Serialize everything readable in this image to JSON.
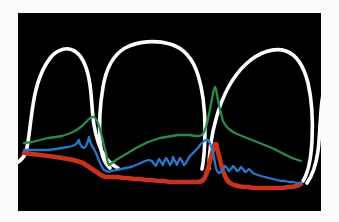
{
  "figure": {
    "background_color": "#fbfbf9",
    "panel_color": "#000000",
    "panel": {
      "x": 18,
      "y": 13,
      "width": 303,
      "height": 198
    }
  },
  "legend_colors": {
    "tooth_outline": "#ffffff",
    "green_curve": "#2a8a4a",
    "blue_curve": "#2878c8",
    "red_curve": "#c83220"
  },
  "series": [
    {
      "name": "gingival-margin",
      "color": "#2a8a4a",
      "label": "Gingival margin contour",
      "points": "6,130 14,129 22,127 30,125 38,124 44,123 50,121 55,119 60,116 64,113 67,110 70,107 72,105 74,104 76,104 78,106 80,110 82,116 84,124 86,132 88,140 89,146 90,150 91,152 94,150 98,147 103,144 108,141 113,138 118,135 124,132 130,129 136,127 142,125 148,124 154,123 160,122 166,122 172,122 177,123 181,123 184,122 186,119 188,114 190,106 192,96 194,86 195,80 196,76 197,74 198,76 199,82 201,92 203,101 205,108 208,113 211,116 215,119 219,121 224,123 229,125 234,127 239,129 244,131 249,133 254,135 258,137 262,139 266,141 270,143 274,145 277,146 280,147 283,148"
    },
    {
      "name": "attachment-level",
      "color": "#2878c8",
      "label": "Clinical attachment level",
      "points": "6,137 14,137 22,137 30,137 38,136 44,135 50,134 54,133 57,132 59,130 61,127 62,131 64,134 66,135 68,133 70,128 71,124 72,128 74,133 76,136 78,140 80,145 82,150 84,154 86,157 88,158 90,159 94,158 98,157 103,156 108,155 113,154 118,152 123,150 127,148 131,147 134,148 136,151 138,153 139,150 141,146 143,149 145,152 146,149 148,145 150,148 152,152 154,149 155,144 157,148 159,152 160,149 162,145 164,148 166,152 168,150 170,146 172,143 174,141 176,139 178,137 180,135 182,132 184,130 186,128 188,127 190,127 192,130 194,136 196,144 197,150 198,155 199,158 201,160 203,159 205,156 207,153 209,155 211,158 213,156 215,153 217,155 219,158 221,157 223,154 225,156 227,159 229,158 231,156 233,158 235,160 237,161 240,162 243,163 247,164 251,165 255,166 259,167 263,168 267,168 271,169 275,169 279,170 283,170"
    },
    {
      "name": "bone-level",
      "color": "#c83220",
      "label": "Alveolar bone level",
      "points": "6,140 14,141 22,142 30,143 38,144 44,145 50,146 55,147 59,148 62,149 65,150 68,152 71,154 74,156 77,158 80,160 83,162 85,163 87,164 89,164 92,164 96,164 100,164 105,165 110,165 116,166 122,166 128,167 134,167 140,168 146,168 152,169 158,169 164,169 170,169 176,169 181,169 184,168 186,166 188,162 190,156 192,148 194,140 196,134 197,131 198,131 199,135 201,143 203,151 205,158 207,163 209,167 212,170 216,172 220,173 225,174 230,174 235,175 240,175 245,175 250,175 255,175 260,175 265,175 270,174 274,174 278,173 281,172 283,171"
    }
  ],
  "teeth": [
    {
      "name": "tooth-left-lateral-incisor",
      "outline": "M -6,152 C 0,150 5,147 8,139 C 11,128 12,110 15,92 C 18,72 24,55 33,44 C 40,36 50,33 58,39 C 66,45 70,58 72,72 C 74,86 74,100 76,112 C 78,124 81,134 86,142 C 90,149 96,153 100,155"
    },
    {
      "name": "tooth-central-incisor-left",
      "outline": "M 92,155 C 86,150 83,140 82,128 C 81,112 82,92 85,74 C 88,56 95,42 107,35 C 120,28 138,27 152,31 C 166,35 175,46 180,62 C 185,78 187,98 187,116 C 187,132 186,146 184,156"
    },
    {
      "name": "tooth-central-incisor-right",
      "outline": "M 191,156 C 191,142 193,124 198,106 C 204,84 214,64 228,51 C 241,39 256,34 268,38 C 279,42 286,54 290,70 C 294,87 295,108 294,128 C 293,146 290,160 285,168"
    },
    {
      "name": "tooth-right-lateral-incisor",
      "outline": "M 289,170 C 294,163 298,152 300,138 C 302,122 302,104 304,88 C 306,74 309,63 314,56"
    }
  ],
  "annotations": {
    "interdental-papilla-left": {
      "x": 90,
      "y": 150
    },
    "interdental-papilla-right": {
      "x": 197,
      "y": 74
    }
  }
}
